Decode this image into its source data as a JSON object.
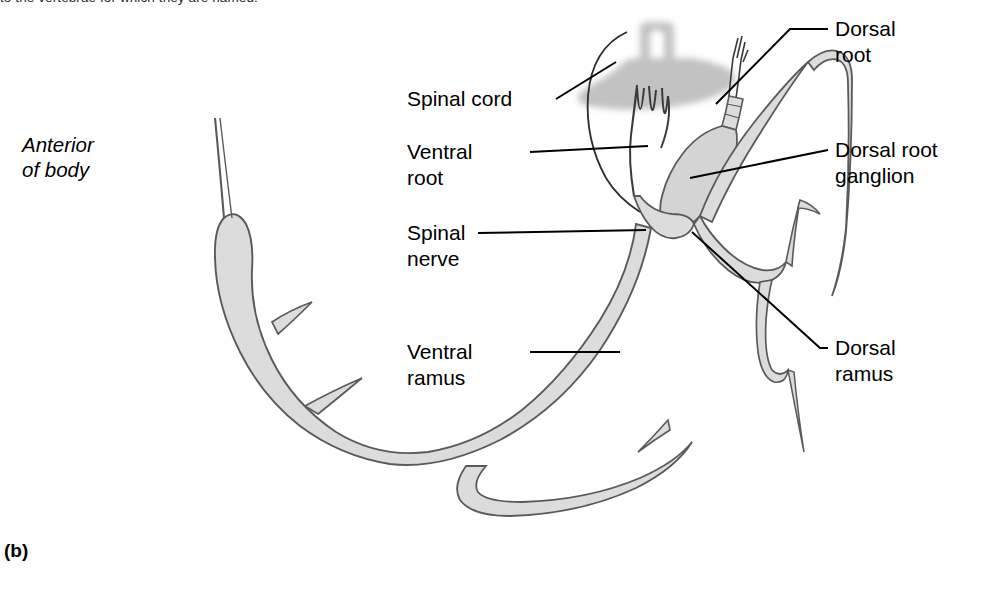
{
  "figure": {
    "top_caption": "to the vertebrae for which they are named.",
    "part_letter": "(b)",
    "orientation_label_line1": "Anterior",
    "orientation_label_line2": "of body"
  },
  "labels": {
    "spinal_cord": "Spinal cord",
    "ventral_root_line1": "Ventral",
    "ventral_root_line2": "root",
    "spinal_nerve_line1": "Spinal",
    "spinal_nerve_line2": "nerve",
    "ventral_ramus_line1": "Ventral",
    "ventral_ramus_line2": "ramus",
    "dorsal_root_line1": "Dorsal",
    "dorsal_root_line2": "root",
    "dorsal_root_ganglion_line1": "Dorsal root",
    "dorsal_root_ganglion_line2": "ganglion",
    "dorsal_ramus_line1": "Dorsal",
    "dorsal_ramus_line2": "ramus"
  },
  "colors": {
    "outline": "#5a5a5a",
    "nerve_fill": "#dcdcdc",
    "ganglion_fill": "#d4d4d4",
    "gray_matter": "#c9c9c9",
    "leader_line": "#000000",
    "text": "#000000",
    "background": "#ffffff"
  }
}
